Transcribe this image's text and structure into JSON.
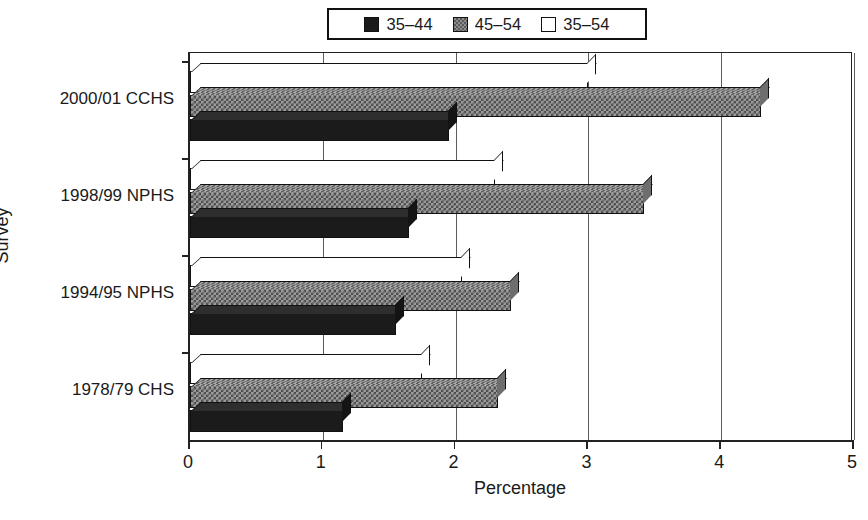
{
  "chart_data": {
    "type": "bar",
    "orientation": "horizontal",
    "title": "",
    "xlabel": "Percentage",
    "ylabel": "Survey",
    "xlim": [
      0,
      5
    ],
    "xticks": [
      "0",
      "1",
      "2",
      "3",
      "4",
      "5"
    ],
    "grid": true,
    "legend_position": "top-center",
    "style": "3d-bar",
    "categories": [
      "2000/01 CCHS",
      "1998/99 NPHS",
      "1994/95 NPHS",
      "1978/79 CHS"
    ],
    "series": [
      {
        "name": "35–44",
        "color": "#1b1b1b",
        "fill": "solid-black",
        "values": [
          1.95,
          1.65,
          1.55,
          1.15
        ]
      },
      {
        "name": "45–54",
        "color": "#8c8c8c",
        "fill": "checker-gray",
        "values": [
          4.3,
          3.42,
          2.42,
          2.32
        ]
      },
      {
        "name": "35–54",
        "color": "#ffffff",
        "fill": "white",
        "values": [
          3.0,
          2.3,
          2.05,
          1.75
        ]
      }
    ]
  },
  "legend": {
    "entries": [
      {
        "label": "35–44",
        "swatch": "black-swatch-icon"
      },
      {
        "label": "45–54",
        "swatch": "gray-checker-swatch-icon"
      },
      {
        "label": "35–54",
        "swatch": "white-swatch-icon"
      }
    ]
  },
  "axes": {
    "x_title": "Percentage",
    "y_title": "Survey",
    "x_ticks": [
      "0",
      "1",
      "2",
      "3",
      "4",
      "5"
    ],
    "y_categories": [
      "2000/01 CCHS",
      "1998/99 NPHS",
      "1994/95 NPHS",
      "1978/79 CHS"
    ]
  }
}
